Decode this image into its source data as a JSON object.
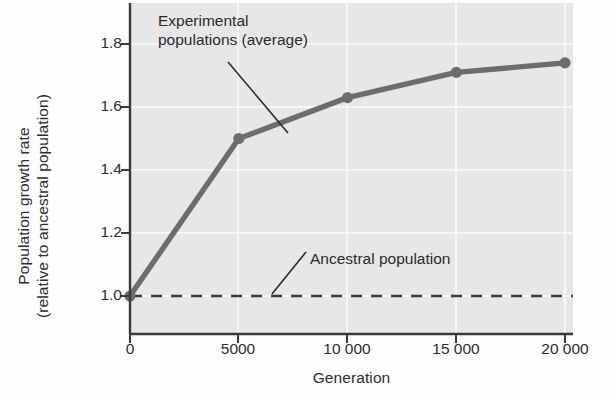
{
  "chart_data": {
    "type": "line",
    "title": "",
    "xlabel": "Generation",
    "ylabel": "Population growth rate (relative to ancestral population)",
    "ylabel_line1": "Population growth rate",
    "ylabel_line2": "(relative to ancestral population)",
    "x": [
      0,
      5000,
      10000,
      15000,
      20000
    ],
    "xtick_labels": [
      "0",
      "5000",
      "10 000",
      "15 000",
      "20 000"
    ],
    "ytick_labels": [
      "1.0",
      "1.2",
      "1.4",
      "1.6",
      "1.8"
    ],
    "ytick_values": [
      1.0,
      1.2,
      1.4,
      1.6,
      1.8
    ],
    "xlim": [
      0,
      21000
    ],
    "ylim": [
      0.94,
      1.88
    ],
    "grid": "both",
    "legend_position": "none",
    "series": [
      {
        "name": "Experimental populations (average)",
        "type": "line",
        "values": [
          1.0,
          1.5,
          1.63,
          1.71,
          1.74
        ],
        "color": "#6d6d6d",
        "markers": true,
        "style": "solid"
      },
      {
        "name": "Ancestral population",
        "type": "line",
        "values": [
          1.0,
          1.0,
          1.0,
          1.0,
          1.0
        ],
        "color": "#3a3a3a",
        "markers": false,
        "style": "dashed"
      }
    ],
    "annotations": [
      {
        "id": "experimental",
        "text": "Experimental populations (average)",
        "line1": "Experimental",
        "line2": "populations (average)",
        "points_to": [
          7200,
          1.545
        ]
      },
      {
        "id": "ancestral",
        "text": "Ancestral population",
        "line1": "Ancestral population",
        "points_to": [
          6400,
          1.0
        ]
      }
    ],
    "colors": {
      "plot_background": "#e7e7e7",
      "page_background": "#fdfdfd",
      "axis": "#3a3a3a",
      "grid": "#f5f5f5",
      "experimental_line": "#6d6d6d",
      "ancestral_line": "#3a3a3a",
      "text": "#2b2b2b"
    }
  }
}
